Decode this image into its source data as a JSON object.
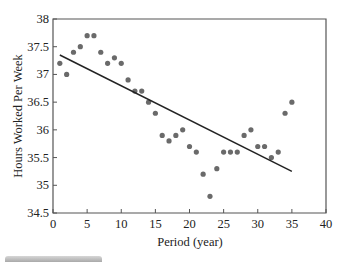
{
  "chart_data": {
    "type": "scatter",
    "title": "",
    "xlabel": "Period (year)",
    "ylabel": "Hours Worked Per Week",
    "xlim": [
      0,
      40
    ],
    "ylim": [
      34.5,
      38
    ],
    "xticks": [
      0,
      5,
      10,
      15,
      20,
      25,
      30,
      35,
      40
    ],
    "yticks": [
      34.5,
      35,
      35.5,
      36,
      36.5,
      37,
      37.5,
      38
    ],
    "ytick_labels": [
      "34.5",
      "35",
      "35.5",
      "36",
      "36.5",
      "37",
      "37.5",
      "38"
    ],
    "grid": false,
    "legend": null,
    "series": [
      {
        "name": "Observed hours",
        "kind": "scatter",
        "color": "#6a6a6a",
        "x": [
          1,
          2,
          3,
          4,
          5,
          6,
          7,
          8,
          9,
          10,
          11,
          12,
          13,
          14,
          15,
          16,
          17,
          18,
          19,
          20,
          21,
          22,
          23,
          24,
          25,
          26,
          27,
          28,
          29,
          30,
          31,
          32,
          33,
          34,
          35
        ],
        "y": [
          37.2,
          37.0,
          37.4,
          37.5,
          37.7,
          37.7,
          37.4,
          37.2,
          37.3,
          37.2,
          36.9,
          36.7,
          36.7,
          36.5,
          36.3,
          35.9,
          35.8,
          35.9,
          36.0,
          35.7,
          35.6,
          35.2,
          34.8,
          35.3,
          35.6,
          35.6,
          35.6,
          35.9,
          36.0,
          35.7,
          35.7,
          35.5,
          35.6,
          36.3,
          36.5
        ]
      },
      {
        "name": "Linear trend",
        "kind": "line",
        "color": "#222222",
        "x": [
          1,
          35
        ],
        "y": [
          37.35,
          35.25
        ]
      }
    ]
  },
  "footer": {
    "bar_label": ""
  }
}
